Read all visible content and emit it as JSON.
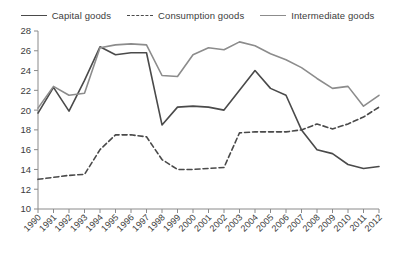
{
  "legend": {
    "position": "top-center",
    "items": [
      {
        "label": "Capital goods",
        "style": "solid",
        "color": "#4a4a4a",
        "name": "legend-capital-goods"
      },
      {
        "label": "Consumption goods",
        "style": "dashed",
        "color": "#4a4a4a",
        "name": "legend-consumption-goods"
      },
      {
        "label": "Intermediate goods",
        "style": "solid",
        "color": "#8c8c8c",
        "name": "legend-intermediate-goods"
      }
    ]
  },
  "chart_data": {
    "type": "line",
    "title": "",
    "subtitle": "",
    "xlabel": "",
    "ylabel": "",
    "grid": false,
    "legend_position": "top",
    "x": [
      1990,
      1991,
      1992,
      1993,
      1994,
      1995,
      1996,
      1997,
      1998,
      1999,
      2000,
      2001,
      2002,
      2003,
      2004,
      2005,
      2006,
      2007,
      2008,
      2009,
      2010,
      2011,
      2012
    ],
    "categories": [
      "1990",
      "1991",
      "1992",
      "1993",
      "1994",
      "1995",
      "1996",
      "1997",
      "1998",
      "1999",
      "2000",
      "2001",
      "2002",
      "2003",
      "2004",
      "2005",
      "2006",
      "2007",
      "2008",
      "2009",
      "2010",
      "2011",
      "2012"
    ],
    "xlim": [
      1990,
      2012
    ],
    "ylim": [
      10,
      28
    ],
    "ytick_values": [
      10,
      12,
      14,
      16,
      18,
      20,
      22,
      24,
      26,
      28
    ],
    "ytick_labels": [
      "10",
      "12",
      "14",
      "16",
      "18",
      "20",
      "22",
      "24",
      "26",
      "28"
    ],
    "series": [
      {
        "name": "Capital goods",
        "style": "solid",
        "color": "#4a4a4a",
        "width": 1.6,
        "values": [
          19.7,
          22.3,
          19.9,
          23.0,
          26.4,
          25.6,
          25.8,
          25.8,
          18.5,
          20.3,
          20.4,
          20.3,
          20.0,
          22.0,
          24.0,
          22.2,
          21.5,
          18.0,
          16.0,
          15.6,
          14.5,
          14.1,
          14.3
        ]
      },
      {
        "name": "Consumption goods",
        "style": "dashed",
        "color": "#4a4a4a",
        "width": 1.6,
        "values": [
          13.0,
          13.2,
          13.4,
          13.5,
          16.0,
          17.5,
          17.5,
          17.3,
          15.0,
          14.0,
          14.0,
          14.1,
          14.2,
          17.7,
          17.8,
          17.8,
          17.8,
          18.0,
          18.6,
          18.1,
          18.6,
          19.3,
          20.3
        ]
      },
      {
        "name": "Intermediate goods",
        "style": "solid",
        "color": "#8c8c8c",
        "width": 1.6,
        "values": [
          20.2,
          22.4,
          21.5,
          21.7,
          26.3,
          26.6,
          26.7,
          26.6,
          23.5,
          23.4,
          25.6,
          26.3,
          26.1,
          26.9,
          26.5,
          25.7,
          25.1,
          24.3,
          23.2,
          22.2,
          22.4,
          20.4,
          21.5
        ]
      }
    ]
  },
  "colors": {
    "axis": "#8a8a8a",
    "text": "#3c3c3c",
    "background": "#ffffff",
    "capital": "#4a4a4a",
    "consumption": "#4a4a4a",
    "intermediate": "#8c8c8c"
  }
}
